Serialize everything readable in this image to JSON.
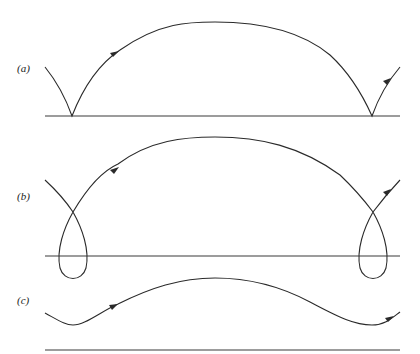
{
  "figure": {
    "panels": [
      {
        "id": "a",
        "label": "(a)",
        "description": "Trajectory with cusps touching the baseline"
      },
      {
        "id": "b",
        "label": "(b)",
        "description": "Trajectory with loops crossing below the baseline"
      },
      {
        "id": "c",
        "label": "(c)",
        "description": "Smooth wavy trajectory staying above the baseline"
      }
    ],
    "colors": {
      "stroke": "#2a2a2a",
      "background": "#ffffff"
    }
  }
}
